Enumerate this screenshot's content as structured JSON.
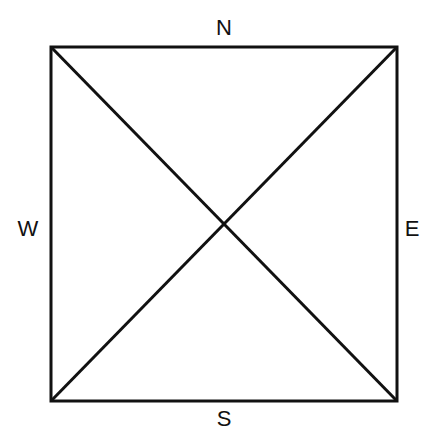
{
  "diagram": {
    "type": "square-with-diagonals",
    "labels": {
      "north": "N",
      "south": "S",
      "east": "E",
      "west": "W"
    },
    "colors": {
      "line": "#111111",
      "background": "#ffffff"
    }
  }
}
